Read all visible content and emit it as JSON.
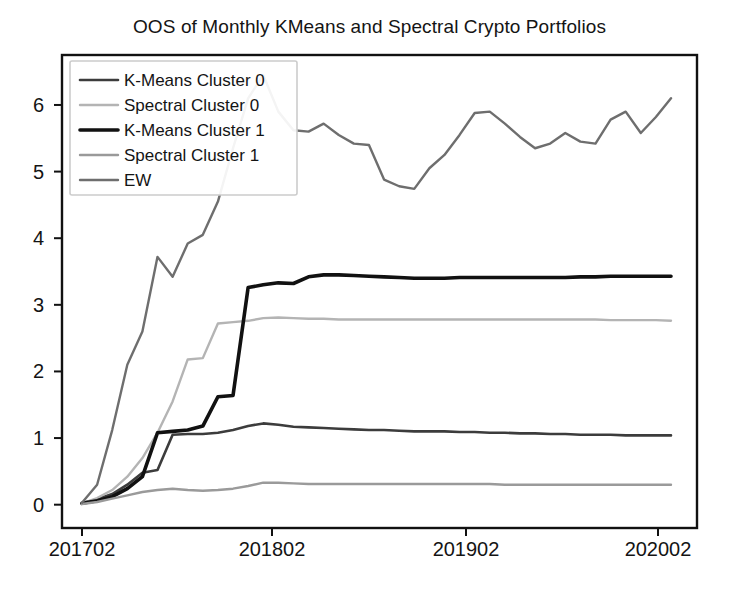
{
  "chart_data": {
    "type": "line",
    "title": "OOS of Monthly KMeans and Spectral Crypto Portfolios",
    "xlabel": "",
    "ylabel": "",
    "grid": false,
    "legend_position": "upper left",
    "xlim": [
      201702,
      202006
    ],
    "ylim": [
      -0.35,
      6.75
    ],
    "yticks": [
      0,
      1,
      2,
      3,
      4,
      5,
      6
    ],
    "ytick_labels": [
      "0",
      "1",
      "2",
      "3",
      "4",
      "5",
      "6"
    ],
    "xticks": [
      201702,
      201802,
      201902,
      202002
    ],
    "xtick_labels": [
      "201702",
      "201802",
      "201902",
      "202002"
    ],
    "x": [
      201702,
      201703,
      201704,
      201705,
      201706,
      201707,
      201708,
      201709,
      201710,
      201711,
      201712,
      201801,
      201802,
      201803,
      201804,
      201805,
      201806,
      201807,
      201808,
      201809,
      201810,
      201811,
      201812,
      201901,
      201902,
      201903,
      201904,
      201905,
      201906,
      201907,
      201808,
      201909,
      201910,
      201911,
      201912,
      202001,
      202002,
      202003,
      202004,
      202005
    ],
    "series": [
      {
        "name": "K-Means Cluster 0",
        "color": "#3c3c3c",
        "width": 2.6,
        "values": [
          0.02,
          0.08,
          0.16,
          0.3,
          0.48,
          0.52,
          1.05,
          1.06,
          1.06,
          1.08,
          1.12,
          1.18,
          1.22,
          1.2,
          1.17,
          1.16,
          1.15,
          1.14,
          1.13,
          1.12,
          1.12,
          1.11,
          1.1,
          1.1,
          1.1,
          1.09,
          1.09,
          1.08,
          1.08,
          1.07,
          1.07,
          1.06,
          1.06,
          1.05,
          1.05,
          1.05,
          1.04,
          1.04,
          1.04,
          1.04
        ]
      },
      {
        "name": "Spectral Cluster 0",
        "color": "#b4b4b4",
        "width": 2.4,
        "values": [
          0.02,
          0.1,
          0.22,
          0.42,
          0.7,
          1.08,
          1.55,
          2.18,
          2.2,
          2.72,
          2.74,
          2.76,
          2.8,
          2.81,
          2.8,
          2.79,
          2.79,
          2.78,
          2.78,
          2.78,
          2.78,
          2.78,
          2.78,
          2.78,
          2.78,
          2.78,
          2.78,
          2.78,
          2.78,
          2.78,
          2.78,
          2.78,
          2.78,
          2.78,
          2.78,
          2.77,
          2.77,
          2.77,
          2.77,
          2.76
        ]
      },
      {
        "name": "K-Means Cluster 1",
        "color": "#111111",
        "width": 3.6,
        "values": [
          0.02,
          0.06,
          0.12,
          0.24,
          0.42,
          1.08,
          1.1,
          1.12,
          1.18,
          1.62,
          1.64,
          3.26,
          3.3,
          3.33,
          3.32,
          3.42,
          3.45,
          3.45,
          3.44,
          3.43,
          3.42,
          3.41,
          3.4,
          3.4,
          3.4,
          3.41,
          3.41,
          3.41,
          3.41,
          3.41,
          3.41,
          3.41,
          3.41,
          3.42,
          3.42,
          3.43,
          3.43,
          3.43,
          3.43,
          3.43
        ]
      },
      {
        "name": "Spectral Cluster 1",
        "color": "#9a9a9a",
        "width": 2.4,
        "values": [
          0.01,
          0.04,
          0.09,
          0.14,
          0.19,
          0.22,
          0.24,
          0.22,
          0.21,
          0.22,
          0.24,
          0.28,
          0.33,
          0.33,
          0.32,
          0.31,
          0.31,
          0.31,
          0.31,
          0.31,
          0.31,
          0.31,
          0.31,
          0.31,
          0.31,
          0.31,
          0.31,
          0.31,
          0.3,
          0.3,
          0.3,
          0.3,
          0.3,
          0.3,
          0.3,
          0.3,
          0.3,
          0.3,
          0.3,
          0.3
        ]
      },
      {
        "name": "EW",
        "color": "#6e6e6e",
        "width": 2.4,
        "values": [
          0.03,
          0.3,
          1.12,
          2.1,
          2.6,
          3.72,
          3.42,
          3.92,
          4.05,
          4.55,
          5.35,
          6.1,
          6.45,
          5.9,
          5.62,
          5.6,
          5.72,
          5.55,
          5.42,
          5.4,
          4.88,
          4.78,
          4.74,
          5.05,
          5.25,
          5.55,
          5.88,
          5.9,
          5.72,
          5.52,
          5.35,
          5.42,
          5.58,
          5.45,
          5.42,
          5.78,
          5.9,
          5.58,
          5.82,
          6.1
        ]
      }
    ]
  },
  "legend": {
    "items": [
      {
        "label": "K-Means Cluster 0"
      },
      {
        "label": "Spectral Cluster 0"
      },
      {
        "label": "K-Means Cluster 1"
      },
      {
        "label": "Spectral Cluster 1"
      },
      {
        "label": "EW"
      }
    ]
  },
  "axes": {
    "frame_color": "#111111"
  }
}
